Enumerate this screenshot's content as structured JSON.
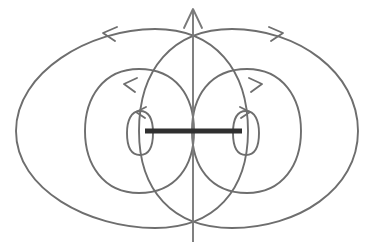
{
  "figure": {
    "canvas": {
      "width": 374,
      "height": 242
    },
    "colors": {
      "background": "#ffffff",
      "field_line": "#6e6e6e",
      "axis_line": "#7a7a7a",
      "dipole_bar": "#2f2f2f"
    },
    "elements": {
      "dipole_bar": {
        "name": "dipole-bar",
        "x1": 145,
        "y1": 131,
        "x2": 242,
        "y2": 131,
        "thickness": 5
      },
      "vertical_axis": {
        "name": "vertical-axis-arrow",
        "x": 193,
        "y_top": 8,
        "y_bottom": 242,
        "direction": "up"
      },
      "loops_left": [
        {
          "name": "inner-loop-left",
          "cx": 140,
          "cy": 133,
          "rx": 13,
          "ry": 22,
          "arrow_dir": "left"
        },
        {
          "name": "middle-loop-left",
          "cx": 138,
          "cy": 131,
          "rx": 53,
          "ry": 62,
          "arrow_dir": "left"
        },
        {
          "name": "outer-loop-left",
          "cx": 133,
          "cy": 130,
          "rx": 118,
          "ry": 100,
          "arrow_dir": "left"
        }
      ],
      "loops_right": [
        {
          "name": "inner-loop-right",
          "cx": 246,
          "cy": 133,
          "rx": 13,
          "ry": 22,
          "arrow_dir": "right"
        },
        {
          "name": "middle-loop-right",
          "cx": 248,
          "cy": 131,
          "rx": 53,
          "ry": 62,
          "arrow_dir": "right"
        },
        {
          "name": "outer-loop-right",
          "cx": 253,
          "cy": 130,
          "rx": 118,
          "ry": 100,
          "arrow_dir": "right"
        }
      ]
    }
  },
  "chart_data": {
    "type": "diagram",
    "subtitle": "",
    "xlabel": "",
    "ylabel": "",
    "legend": [],
    "annotations": [
      {
        "label": "current element / dipole bar",
        "kind": "bar",
        "x_range": [
          145,
          242
        ],
        "y": 131
      },
      {
        "label": "symmetry axis, arrow up",
        "kind": "arrow",
        "x": 193,
        "y_range": [
          8,
          242
        ]
      },
      {
        "label": "left field loops, arrows point left (counter-clockwise)",
        "count": 3
      },
      {
        "label": "right field loops, arrows point right (clockwise)",
        "count": 3
      }
    ],
    "series": [
      {
        "name": "left-loops",
        "values": [
          {
            "loop": "inner",
            "cx": 140,
            "cy": 133,
            "rx": 13,
            "ry": 22
          },
          {
            "loop": "middle",
            "cx": 138,
            "cy": 131,
            "rx": 53,
            "ry": 62
          },
          {
            "loop": "outer",
            "cx": 133,
            "cy": 130,
            "rx": 118,
            "ry": 100
          }
        ]
      },
      {
        "name": "right-loops",
        "values": [
          {
            "loop": "inner",
            "cx": 246,
            "cy": 133,
            "rx": 13,
            "ry": 22
          },
          {
            "loop": "middle",
            "cx": 248,
            "cy": 131,
            "rx": 53,
            "ry": 62
          },
          {
            "loop": "outer",
            "cx": 253,
            "cy": 130,
            "rx": 118,
            "ry": 100
          }
        ]
      }
    ],
    "arrow_markers": [
      {
        "name": "outer-left-arrow",
        "x": 105,
        "y": 32,
        "dir": "left"
      },
      {
        "name": "outer-right-arrow",
        "x": 280,
        "y": 32,
        "dir": "right"
      },
      {
        "name": "middle-left-arrow",
        "x": 127,
        "y": 85,
        "dir": "left"
      },
      {
        "name": "middle-right-arrow",
        "x": 259,
        "y": 85,
        "dir": "right"
      },
      {
        "name": "inner-left-arrow",
        "x": 142,
        "y": 112,
        "dir": "left"
      },
      {
        "name": "inner-right-arrow",
        "x": 243,
        "y": 112,
        "dir": "right"
      },
      {
        "name": "axis-arrow",
        "x": 193,
        "y": 9,
        "dir": "up"
      }
    ],
    "axis_ranges": {
      "x": [
        0,
        374
      ],
      "y": [
        0,
        242
      ]
    },
    "grid": false
  }
}
